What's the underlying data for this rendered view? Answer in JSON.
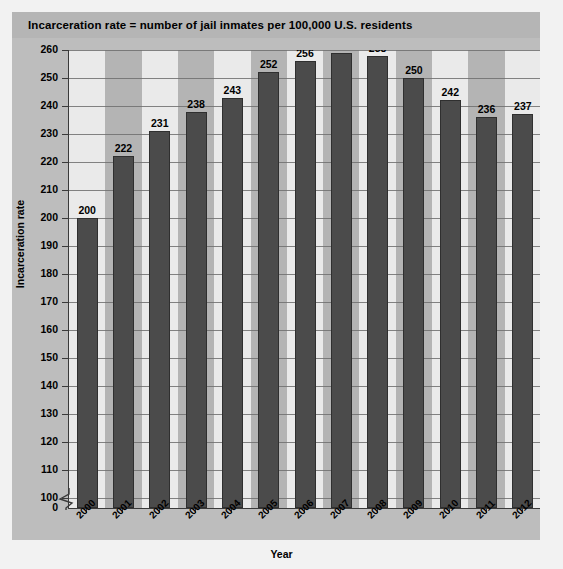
{
  "banner": {
    "note": "Incarceration rate = number of jail inmates per 100,000 U.S. residents"
  },
  "chart_data": {
    "type": "bar",
    "title": "Incarceration rate = number of jail inmates per 100,000 U.S. residents",
    "xlabel": "Year",
    "ylabel": "Incarceration rate",
    "categories": [
      "2000",
      "2001",
      "2002",
      "2003",
      "2004",
      "2005",
      "2006",
      "2007",
      "2008",
      "2009",
      "2010",
      "2011",
      "2012"
    ],
    "values": [
      200,
      222,
      231,
      238,
      243,
      252,
      256,
      259,
      258,
      250,
      242,
      236,
      237
    ],
    "yticks": [
      0,
      100,
      110,
      120,
      130,
      140,
      150,
      160,
      170,
      180,
      190,
      200,
      210,
      220,
      230,
      240,
      250,
      260
    ],
    "ylim": [
      100,
      260
    ],
    "axis_break": true,
    "axis_break_between": [
      0,
      100
    ],
    "grid": true,
    "legend": "none",
    "bar_color": "#4b4b4b",
    "band_colors": [
      "#eaeaea",
      "#b4b4b4"
    ],
    "plot_background": "#c4c4c4",
    "data_labels": [
      "200",
      "222",
      "231",
      "238",
      "243",
      "252",
      "256",
      "259",
      "258",
      "250",
      "242",
      "236",
      "237"
    ]
  }
}
